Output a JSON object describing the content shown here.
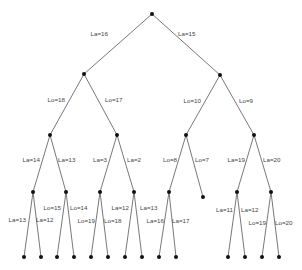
{
  "diagram": {
    "type": "binary-tree",
    "colors": {
      "edge": "#555555",
      "node": "#111111",
      "label": "#444444",
      "background": "#ffffff"
    },
    "nodes": [
      {
        "id": "n0",
        "x": 152,
        "y": 14
      },
      {
        "id": "n1",
        "x": 84,
        "y": 74
      },
      {
        "id": "n2",
        "x": 220,
        "y": 75
      },
      {
        "id": "n3",
        "x": 50,
        "y": 135
      },
      {
        "id": "n4",
        "x": 117,
        "y": 135
      },
      {
        "id": "n5",
        "x": 186,
        "y": 135
      },
      {
        "id": "n6",
        "x": 254,
        "y": 135
      },
      {
        "id": "n7",
        "x": 33,
        "y": 192
      },
      {
        "id": "n8",
        "x": 66,
        "y": 192
      },
      {
        "id": "n9",
        "x": 100,
        "y": 192
      },
      {
        "id": "n10",
        "x": 134,
        "y": 192
      },
      {
        "id": "n11",
        "x": 169,
        "y": 192
      },
      {
        "id": "n12",
        "x": 203,
        "y": 197
      },
      {
        "id": "n13",
        "x": 237,
        "y": 192
      },
      {
        "id": "n14",
        "x": 271,
        "y": 192
      },
      {
        "id": "l0",
        "x": 24,
        "y": 257
      },
      {
        "id": "l1",
        "x": 41,
        "y": 257
      },
      {
        "id": "l2",
        "x": 57,
        "y": 257
      },
      {
        "id": "l3",
        "x": 74,
        "y": 257
      },
      {
        "id": "l4",
        "x": 91,
        "y": 257
      },
      {
        "id": "l5",
        "x": 108,
        "y": 257
      },
      {
        "id": "l6",
        "x": 125,
        "y": 257
      },
      {
        "id": "l7",
        "x": 142,
        "y": 257
      },
      {
        "id": "l8",
        "x": 159,
        "y": 257
      },
      {
        "id": "l9",
        "x": 176,
        "y": 257
      },
      {
        "id": "l10",
        "x": 228,
        "y": 257
      },
      {
        "id": "l11",
        "x": 245,
        "y": 257
      },
      {
        "id": "l12",
        "x": 262,
        "y": 257
      },
      {
        "id": "l13",
        "x": 279,
        "y": 257
      }
    ],
    "edges": [
      {
        "from": "n0",
        "to": "n1",
        "label": "La=16",
        "lx": 108,
        "ly": 36,
        "anchor": "end"
      },
      {
        "from": "n0",
        "to": "n2",
        "label": "La=15",
        "lx": 178,
        "ly": 36,
        "anchor": "start"
      },
      {
        "from": "n1",
        "to": "n3",
        "label": "Lo=18",
        "lx": 65,
        "ly": 102,
        "anchor": "end"
      },
      {
        "from": "n1",
        "to": "n4",
        "label": "Lo=17",
        "lx": 105,
        "ly": 102,
        "anchor": "start"
      },
      {
        "from": "n2",
        "to": "n5",
        "label": "Lo=10",
        "lx": 201,
        "ly": 103,
        "anchor": "end"
      },
      {
        "from": "n2",
        "to": "n6",
        "label": "Lo=9",
        "lx": 239,
        "ly": 103,
        "anchor": "start"
      },
      {
        "from": "n3",
        "to": "n7",
        "label": "La=14",
        "lx": 40,
        "ly": 162,
        "anchor": "end"
      },
      {
        "from": "n3",
        "to": "n8",
        "label": "La=13",
        "lx": 58,
        "ly": 162,
        "anchor": "start"
      },
      {
        "from": "n4",
        "to": "n9",
        "label": "La=3",
        "lx": 107,
        "ly": 162,
        "anchor": "end"
      },
      {
        "from": "n4",
        "to": "n10",
        "label": "La=2",
        "lx": 127,
        "ly": 162,
        "anchor": "start"
      },
      {
        "from": "n5",
        "to": "n11",
        "label": "Lo=8",
        "lx": 177,
        "ly": 162,
        "anchor": "end"
      },
      {
        "from": "n5",
        "to": "n12",
        "label": "Lo=7",
        "lx": 195,
        "ly": 162,
        "anchor": "start"
      },
      {
        "from": "n6",
        "to": "n13",
        "label": "La=19",
        "lx": 245,
        "ly": 162,
        "anchor": "end"
      },
      {
        "from": "n6",
        "to": "n14",
        "label": "La=20",
        "lx": 263,
        "ly": 162,
        "anchor": "start"
      },
      {
        "from": "n7",
        "to": "l0",
        "label": "La=13",
        "lx": 26,
        "ly": 222,
        "anchor": "end"
      },
      {
        "from": "n7",
        "to": "l1",
        "label": "La=12",
        "lx": 36,
        "ly": 222,
        "anchor": "start"
      },
      {
        "from": "n8",
        "to": "l2",
        "label": "Lo=15",
        "lx": 61,
        "ly": 210,
        "anchor": "end"
      },
      {
        "from": "n8",
        "to": "l3",
        "label": "Lo=14",
        "lx": 70,
        "ly": 210,
        "anchor": "start"
      },
      {
        "from": "n9",
        "to": "l4",
        "label": "Lo=19",
        "lx": 95,
        "ly": 223,
        "anchor": "end"
      },
      {
        "from": "n9",
        "to": "l5",
        "label": "Lo=18",
        "lx": 104,
        "ly": 223,
        "anchor": "start"
      },
      {
        "from": "n10",
        "to": "l6",
        "label": "La=12",
        "lx": 129,
        "ly": 210,
        "anchor": "end"
      },
      {
        "from": "n10",
        "to": "l7",
        "label": "La=13",
        "lx": 140,
        "ly": 210,
        "anchor": "start"
      },
      {
        "from": "n11",
        "to": "l8",
        "label": "La=16",
        "lx": 164,
        "ly": 223,
        "anchor": "end"
      },
      {
        "from": "n11",
        "to": "l9",
        "label": "La=17",
        "lx": 172,
        "ly": 223,
        "anchor": "start"
      },
      {
        "from": "n13",
        "to": "l10",
        "label": "La=11",
        "lx": 233,
        "ly": 212,
        "anchor": "end"
      },
      {
        "from": "n13",
        "to": "l11",
        "label": "La=12",
        "lx": 241,
        "ly": 212,
        "anchor": "start"
      },
      {
        "from": "n14",
        "to": "l12",
        "label": "Lo=19",
        "lx": 266,
        "ly": 225,
        "anchor": "end"
      },
      {
        "from": "n14",
        "to": "l13",
        "label": "Lo=20",
        "lx": 275,
        "ly": 225,
        "anchor": "start"
      }
    ]
  }
}
